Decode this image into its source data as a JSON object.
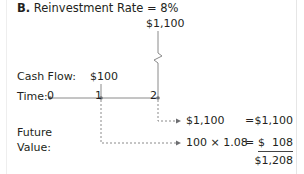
{
  "title": {
    "label": "B.",
    "text": "Reinvestment Rate = 8%"
  },
  "top_flow": {
    "amount": "$1,100"
  },
  "cash_flow": {
    "label": "Cash Flow:",
    "amount_t1": "$100"
  },
  "timeline": {
    "label": "Time:",
    "ticks": [
      "0",
      "1",
      "2"
    ]
  },
  "future_value": {
    "label_line1": "Future",
    "label_line2": "Value:",
    "rows": [
      {
        "expr": "$1,100",
        "equals": "=",
        "result": "$1,100"
      },
      {
        "expr": "100 × 1.08",
        "equals": "=",
        "result_currency": "$",
        "result": "108"
      }
    ],
    "total": "$1,208"
  },
  "colors": {
    "line": "#8a8a8a",
    "dot": "#6d6e71",
    "text": "#231f20"
  }
}
